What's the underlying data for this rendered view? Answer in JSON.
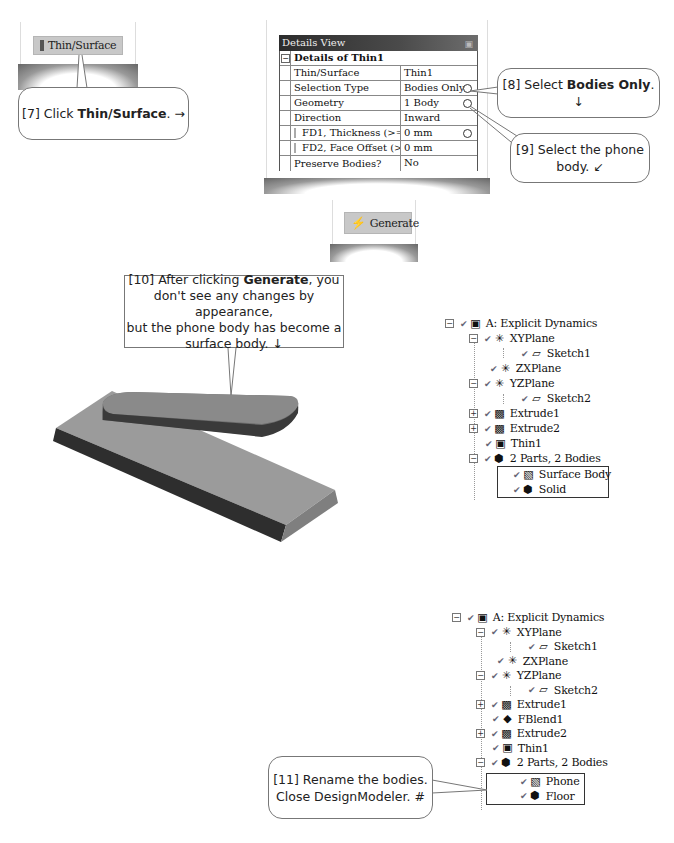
{
  "step7": {
    "button_label": "Thin/Surface",
    "button_icon": "thin-surface-icon",
    "callout": {
      "prefix": "[7] Click ",
      "bold": "Thin/Surface",
      "suffix": ". →"
    }
  },
  "details_view": {
    "title": "Details View",
    "pin_icon": "␣",
    "section_title": "Details of Thin1",
    "rows": [
      {
        "key": "Thin/Surface",
        "value": "Thin1",
        "checkbox": false,
        "ring": false
      },
      {
        "key": "Selection Type",
        "value": "Bodies Only",
        "checkbox": false,
        "ring": true
      },
      {
        "key": "Geometry",
        "value": "1 Body",
        "checkbox": false,
        "ring": true
      },
      {
        "key": "Direction",
        "value": "Inward",
        "checkbox": false,
        "ring": false
      },
      {
        "key": "FD1, Thickness (>=0)",
        "value": "0 mm",
        "checkbox": true,
        "ring": true
      },
      {
        "key": "FD2, Face Offset (>=0)",
        "value": "0 mm",
        "checkbox": true,
        "ring": false
      },
      {
        "key": "Preserve Bodies?",
        "value": "No",
        "checkbox": false,
        "ring": false
      }
    ]
  },
  "step8": {
    "callout": {
      "prefix": "[8] Select ",
      "bold": "Bodies Only",
      "suffix": ". ↓"
    }
  },
  "step9": {
    "callout": {
      "line1": "[9] Select the phone",
      "line2": "body. ↙"
    }
  },
  "generate": {
    "button_label": "Generate",
    "button_icon": "⚡"
  },
  "step10": {
    "callout": {
      "prefix": "[10] After clicking ",
      "bold": "Generate",
      "line1_suffix": ", you",
      "line2": "don't see any changes by appearance,",
      "line3": "but the phone body has become a",
      "line4": "surface body. ↓"
    }
  },
  "tree1": {
    "nodes": [
      {
        "label": "A: Explicit Dynamics",
        "icon": "model-icon",
        "glyph": "▣",
        "expander": "-"
      },
      {
        "label": "XYPlane",
        "icon": "plane-icon",
        "glyph": "✳",
        "expander": "-"
      },
      {
        "label": "Sketch1",
        "icon": "sketch-icon",
        "glyph": "▱",
        "expander": ""
      },
      {
        "label": "ZXPlane",
        "icon": "plane-icon",
        "glyph": "✳",
        "expander": ""
      },
      {
        "label": "YZPlane",
        "icon": "plane-icon",
        "glyph": "✳",
        "expander": "-"
      },
      {
        "label": "Sketch2",
        "icon": "sketch-icon",
        "glyph": "▱",
        "expander": ""
      },
      {
        "label": "Extrude1",
        "icon": "extrude-icon",
        "glyph": "▩",
        "expander": "+"
      },
      {
        "label": "Extrude2",
        "icon": "extrude-icon",
        "glyph": "▩",
        "expander": "+"
      },
      {
        "label": "Thin1",
        "icon": "thin-icon",
        "glyph": "▣",
        "expander": ""
      },
      {
        "label": "2 Parts, 2 Bodies",
        "icon": "parts-icon",
        "glyph": "⬢",
        "expander": "-"
      },
      {
        "label": "Surface Body",
        "icon": "surface-body-icon",
        "glyph": "▧",
        "expander": ""
      },
      {
        "label": "Solid",
        "icon": "solid-body-icon",
        "glyph": "⬢",
        "expander": ""
      }
    ]
  },
  "tree2": {
    "nodes": [
      {
        "label": "A: Explicit Dynamics",
        "icon": "model-icon",
        "glyph": "▣",
        "expander": "-"
      },
      {
        "label": "XYPlane",
        "icon": "plane-icon",
        "glyph": "✳",
        "expander": "-"
      },
      {
        "label": "Sketch1",
        "icon": "sketch-icon",
        "glyph": "▱",
        "expander": ""
      },
      {
        "label": "ZXPlane",
        "icon": "plane-icon",
        "glyph": "✳",
        "expander": ""
      },
      {
        "label": "YZPlane",
        "icon": "plane-icon",
        "glyph": "✳",
        "expander": "-"
      },
      {
        "label": "Sketch2",
        "icon": "sketch-icon",
        "glyph": "▱",
        "expander": ""
      },
      {
        "label": "Extrude1",
        "icon": "extrude-icon",
        "glyph": "▩",
        "expander": "+"
      },
      {
        "label": "FBlend1",
        "icon": "blend-icon",
        "glyph": "◆",
        "expander": ""
      },
      {
        "label": "Extrude2",
        "icon": "extrude-icon",
        "glyph": "▩",
        "expander": "+"
      },
      {
        "label": "Thin1",
        "icon": "thin-icon",
        "glyph": "▣",
        "expander": ""
      },
      {
        "label": "2 Parts, 2 Bodies",
        "icon": "parts-icon",
        "glyph": "⬢",
        "expander": "-"
      },
      {
        "label": "Phone",
        "icon": "surface-body-icon",
        "glyph": "▧",
        "expander": ""
      },
      {
        "label": "Floor",
        "icon": "solid-body-icon",
        "glyph": "⬢",
        "expander": ""
      }
    ]
  },
  "step11": {
    "callout": {
      "line1": "[11] Rename the bodies.",
      "line2": "Close DesignModeler.  #"
    }
  },
  "check_glyph": "✔"
}
